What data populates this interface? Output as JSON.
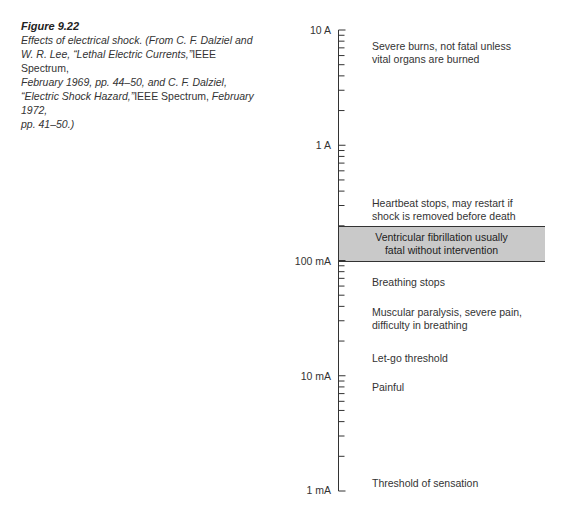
{
  "caption": {
    "figure_label": "Figure 9.22",
    "line1": "Effects of electrical shock. (From C. F. Dalziel and",
    "line2a": "W. R. Lee, “Lethal Electric Currents,”",
    "line2b": "IEEE Spectrum,",
    "line3": "February 1969, pp. 44–50, and C. F. Dalziel,",
    "line4a": "“Electric Shock Hazard,”",
    "line4b": "IEEE Spectrum,",
    "line4c": " February 1972,",
    "line5": "pp. 41–50.)"
  },
  "chart_data": {
    "type": "table",
    "title": "Effects of electrical shock",
    "scale": "log",
    "axis": {
      "unit": "current",
      "tick_labels": [
        "10 A",
        "1 A",
        "100 mA",
        "10 mA",
        "1 mA"
      ],
      "tick_values_A": [
        10,
        1,
        0.1,
        0.01,
        0.001
      ],
      "range_A": [
        0.001,
        10
      ],
      "minor_ticks": "2-9 per decade"
    },
    "regions": [
      {
        "label": "Severe burns, not fatal unless vital organs are burned",
        "approx_current_A": 6
      },
      {
        "label": "Heartbeat stops, may restart if shock is removed before death",
        "approx_current_A": 0.25
      },
      {
        "label": "Ventricular fibrillation usually fatal without intervention",
        "range_A": [
          0.1,
          0.2
        ],
        "highlighted": true
      },
      {
        "label": "Breathing stops",
        "approx_current_A": 0.07
      },
      {
        "label": "Muscular paralysis, severe pain, difficulty in breathing",
        "approx_current_A": 0.04
      },
      {
        "label": "Let-go threshold",
        "approx_current_A": 0.016
      },
      {
        "label": "Painful",
        "approx_current_A": 0.009
      },
      {
        "label": "Threshold of sensation",
        "approx_current_A": 0.001
      }
    ],
    "band_color": "#c9c9c9"
  },
  "axis_labels": [
    "10 A",
    "1 A",
    "100 mA",
    "10 mA",
    "1 mA"
  ],
  "regions": {
    "severe_burns": [
      "Severe burns, not fatal unless",
      "vital organs are burned"
    ],
    "heartbeat": [
      "Heartbeat stops, may restart if",
      "shock is removed before death"
    ],
    "fibrillation": [
      "Ventricular fibrillation usually",
      "fatal without intervention"
    ],
    "breathing": [
      "Breathing stops"
    ],
    "paralysis": [
      "Muscular paralysis, severe pain,",
      "difficulty in breathing"
    ],
    "letgo": [
      "Let-go threshold"
    ],
    "painful": [
      "Painful"
    ],
    "sensation": [
      "Threshold of sensation"
    ]
  }
}
